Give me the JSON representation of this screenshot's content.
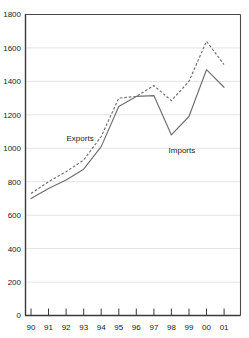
{
  "chart_data": {
    "type": "line",
    "title": "",
    "xlabel": "",
    "ylabel": "",
    "ylim": [
      0,
      1800
    ],
    "ytick_step": 200,
    "yticks": [
      0,
      200,
      400,
      600,
      800,
      1000,
      1200,
      1400,
      1600,
      1800
    ],
    "categories": [
      "90",
      "91",
      "92",
      "93",
      "94",
      "95",
      "96",
      "97",
      "98",
      "99",
      "00",
      "01"
    ],
    "grid": "horizontal",
    "legend_position": "inline-annotation",
    "series": [
      {
        "name": "Exports",
        "style": "dashed",
        "color": "#6e6e6e",
        "values": [
          730,
          800,
          860,
          930,
          1070,
          1300,
          1310,
          1375,
          1285,
          1400,
          1640,
          1500
        ]
      },
      {
        "name": "Imports",
        "style": "solid",
        "color": "#6e6e6e",
        "values": [
          700,
          760,
          810,
          875,
          1010,
          1250,
          1310,
          1315,
          1080,
          1190,
          1470,
          1365
        ]
      }
    ],
    "annotations": [
      {
        "text": "Exports",
        "x_value": "92.8",
        "y_value": 1060
      },
      {
        "text": "Imports",
        "x_value": "98.6",
        "y_value": 990
      }
    ]
  },
  "axis": {
    "y_labels": [
      "1800",
      "1600",
      "1400",
      "1200",
      "1000",
      "800",
      "600",
      "400",
      "200",
      "0"
    ],
    "x_labels": [
      "90",
      "91",
      "92",
      "93",
      "94",
      "95",
      "96",
      "97",
      "98",
      "99",
      "00",
      "01"
    ]
  },
  "annotations": {
    "exports_label": "Exports",
    "imports_label": "Imports"
  },
  "colors": {
    "line": "#6e6e6e",
    "grid": "#d9d9d9",
    "axis": "#3a3a3a",
    "text": "#1a1a1a",
    "background": "#ffffff"
  }
}
